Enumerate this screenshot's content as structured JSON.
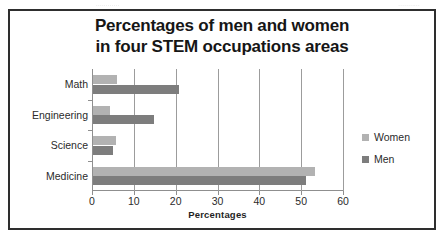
{
  "artifacts": {
    "top_left_smudge": "............",
    "top_right_smudge": "..........."
  },
  "chart_data": {
    "type": "bar",
    "orientation": "horizontal",
    "title": "Percentages of men and women",
    "title_line2": "in four STEM occupations areas",
    "categories": [
      "Math",
      "Engineering",
      "Science",
      "Medicine"
    ],
    "series": [
      {
        "name": "Women",
        "color": "#b2b2b2",
        "values": [
          5.7,
          4.0,
          5.5,
          53.0
        ]
      },
      {
        "name": "Men",
        "color": "#7d7d7d",
        "values": [
          20.5,
          14.5,
          4.8,
          51.0
        ]
      }
    ],
    "xlabel": "Percentages",
    "ylabel": "",
    "xlim": [
      0,
      60
    ],
    "xticks": [
      0,
      10,
      20,
      30,
      40,
      50,
      60
    ],
    "xtick_labels": [
      "0",
      "10",
      "20",
      "30",
      "40",
      "50",
      "60"
    ],
    "grid": "vertical",
    "legend_position": "right",
    "legend_entries": [
      "Women",
      "Men"
    ]
  }
}
